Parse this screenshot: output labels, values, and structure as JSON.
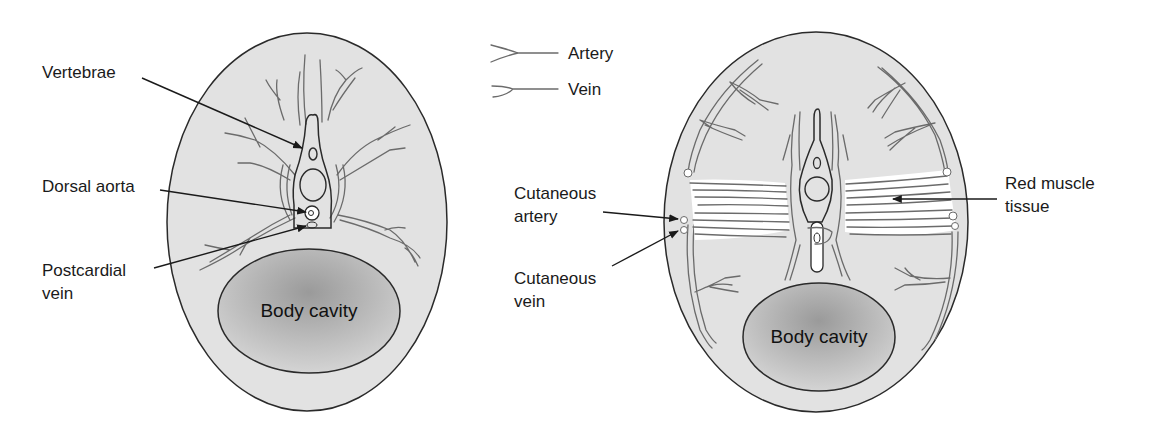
{
  "figure": {
    "legend": {
      "items": [
        {
          "label": "Artery",
          "icon": "artery-line-icon"
        },
        {
          "label": "Vein",
          "icon": "vein-line-icon"
        }
      ]
    },
    "left_section": {
      "labels": {
        "vertebrae": "Vertebrae",
        "dorsal_aorta": "Dorsal aorta",
        "postcardial_vein_line1": "Postcardial",
        "postcardial_vein_line2": "vein",
        "body_cavity": "Body cavity"
      }
    },
    "right_section": {
      "labels": {
        "cutaneous_artery_line1": "Cutaneous",
        "cutaneous_artery_line2": "artery",
        "cutaneous_vein_line1": "Cutaneous",
        "cutaneous_vein_line2": "vein",
        "red_muscle_line1": "Red muscle",
        "red_muscle_line2": "tissue",
        "body_cavity": "Body cavity"
      }
    },
    "colors": {
      "tissue_fill": "#e2e2e2",
      "cavity_center": "#9a9a9a",
      "cavity_edge": "#d2d2d2",
      "vessel_stroke": "#6b6b6b",
      "outline": "#2a2a2a",
      "muscle_fill": "#ffffff"
    }
  }
}
